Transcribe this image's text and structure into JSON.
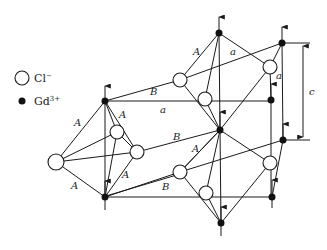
{
  "legend": {
    "items": [
      {
        "symbol": "open-circle",
        "ion": "Cl",
        "charge": "−"
      },
      {
        "symbol": "filled-circle",
        "ion": "Gd",
        "charge": "3+"
      }
    ]
  },
  "labels": {
    "A": "A",
    "B": "B",
    "a": "a",
    "c": "c"
  },
  "colors": {
    "line": "#1a1a1a",
    "gd_fill": "#111111",
    "cl_fill": "#ffffff"
  }
}
